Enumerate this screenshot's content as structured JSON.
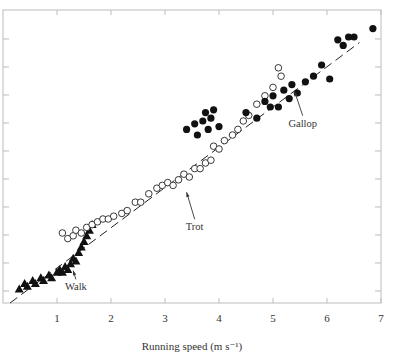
{
  "chart_data": {
    "type": "scatter",
    "title": "",
    "xlabel": "Running speed (m s⁻¹)",
    "ylabel": "",
    "xlim": [
      0,
      7
    ],
    "ylim": [
      0,
      10.5
    ],
    "x_ticks": [
      1,
      2,
      3,
      4,
      5,
      6,
      7
    ],
    "y_ticks_unlabeled": [
      0.43,
      1.43,
      2.43,
      3.43,
      4.43,
      5.43,
      6.43,
      7.43,
      8.43,
      9.43
    ],
    "grid": false,
    "legend": "none (gaits labelled inline with arrows)",
    "trend_line": {
      "style": "dashed",
      "from": [
        0.13,
        0.0
      ],
      "to": [
        6.6,
        9.3
      ]
    },
    "annotations": [
      {
        "text": "Walk",
        "text_pos": [
          1.35,
          0.45
        ],
        "arrow_to": [
          1.3,
          1.3
        ]
      },
      {
        "text": "Trot",
        "text_pos": [
          3.55,
          2.6
        ],
        "arrow_to": [
          3.4,
          4.1
        ]
      },
      {
        "text": "Gallop",
        "text_pos": [
          5.55,
          6.3
        ],
        "arrow_to": [
          5.4,
          7.7
        ]
      }
    ],
    "series": [
      {
        "name": "Walk",
        "marker": "filled-triangle",
        "points": [
          [
            0.3,
            0.5
          ],
          [
            0.4,
            0.7
          ],
          [
            0.45,
            0.6
          ],
          [
            0.55,
            0.8
          ],
          [
            0.6,
            0.7
          ],
          [
            0.7,
            0.9
          ],
          [
            0.75,
            0.8
          ],
          [
            0.85,
            1.0
          ],
          [
            0.9,
            0.9
          ],
          [
            1.0,
            1.1
          ],
          [
            1.05,
            1.2
          ],
          [
            1.1,
            1.1
          ],
          [
            1.15,
            1.3
          ],
          [
            1.2,
            1.2
          ],
          [
            1.25,
            1.4
          ],
          [
            1.3,
            1.6
          ],
          [
            1.35,
            1.5
          ],
          [
            1.4,
            1.8
          ],
          [
            1.45,
            2.0
          ],
          [
            1.5,
            2.2
          ],
          [
            1.55,
            2.4
          ],
          [
            1.6,
            2.6
          ],
          [
            1.65,
            2.8
          ]
        ]
      },
      {
        "name": "Trot",
        "marker": "open-circle",
        "points": [
          [
            1.1,
            2.5
          ],
          [
            1.2,
            2.3
          ],
          [
            1.3,
            2.4
          ],
          [
            1.35,
            2.6
          ],
          [
            1.45,
            2.5
          ],
          [
            1.55,
            2.7
          ],
          [
            1.65,
            2.8
          ],
          [
            1.75,
            2.9
          ],
          [
            1.85,
            3.0
          ],
          [
            1.95,
            3.0
          ],
          [
            2.05,
            3.1
          ],
          [
            2.2,
            3.2
          ],
          [
            2.3,
            3.3
          ],
          [
            2.45,
            3.6
          ],
          [
            2.55,
            3.6
          ],
          [
            2.7,
            3.9
          ],
          [
            2.85,
            4.1
          ],
          [
            2.95,
            4.2
          ],
          [
            3.05,
            4.3
          ],
          [
            3.15,
            4.2
          ],
          [
            3.25,
            4.4
          ],
          [
            3.35,
            4.6
          ],
          [
            3.45,
            4.5
          ],
          [
            3.55,
            4.8
          ],
          [
            3.65,
            4.8
          ],
          [
            3.75,
            5.0
          ],
          [
            3.85,
            5.1
          ],
          [
            3.9,
            5.6
          ],
          [
            4.0,
            5.5
          ],
          [
            4.1,
            5.8
          ],
          [
            4.25,
            6.0
          ],
          [
            4.35,
            6.2
          ],
          [
            4.45,
            6.5
          ],
          [
            4.55,
            6.7
          ],
          [
            4.7,
            7.1
          ],
          [
            4.85,
            7.4
          ],
          [
            5.0,
            7.7
          ],
          [
            5.1,
            8.4
          ],
          [
            5.15,
            8.1
          ]
        ]
      },
      {
        "name": "Gallop",
        "marker": "filled-circle",
        "points": [
          [
            3.4,
            6.2
          ],
          [
            3.55,
            6.4
          ],
          [
            3.6,
            6.0
          ],
          [
            3.7,
            6.5
          ],
          [
            3.75,
            6.8
          ],
          [
            3.8,
            6.2
          ],
          [
            3.85,
            6.6
          ],
          [
            3.9,
            6.9
          ],
          [
            4.0,
            6.3
          ],
          [
            4.5,
            6.8
          ],
          [
            4.7,
            6.6
          ],
          [
            4.85,
            7.2
          ],
          [
            4.95,
            7.0
          ],
          [
            5.0,
            7.4
          ],
          [
            5.1,
            7.0
          ],
          [
            5.2,
            7.6
          ],
          [
            5.3,
            7.3
          ],
          [
            5.35,
            7.8
          ],
          [
            5.45,
            7.5
          ],
          [
            5.6,
            7.9
          ],
          [
            5.75,
            8.1
          ],
          [
            5.9,
            8.5
          ],
          [
            6.05,
            8.0
          ],
          [
            6.2,
            9.4
          ],
          [
            6.3,
            9.2
          ],
          [
            6.4,
            9.5
          ],
          [
            6.5,
            9.5
          ],
          [
            6.85,
            9.8
          ]
        ]
      }
    ]
  }
}
